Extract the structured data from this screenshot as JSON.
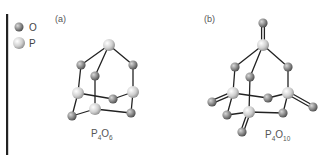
{
  "legend": {
    "items": [
      {
        "symbol": "O",
        "label": "O",
        "color": "#8a8a8a",
        "radius": 4.5
      },
      {
        "symbol": "P",
        "label": "P",
        "color": "#cfcfcf",
        "radius": 6
      }
    ]
  },
  "panels": [
    {
      "id": "a",
      "label": "(a)",
      "formula": {
        "base1": "P",
        "sub1": "4",
        "base2": "O",
        "sub2": "6"
      },
      "atoms": [
        {
          "el": "P",
          "x": 109,
          "y": 45
        },
        {
          "el": "O",
          "x": 81,
          "y": 65
        },
        {
          "el": "O",
          "x": 95,
          "y": 76
        },
        {
          "el": "O",
          "x": 133,
          "y": 65
        },
        {
          "el": "P",
          "x": 78,
          "y": 93
        },
        {
          "el": "O",
          "x": 113,
          "y": 99
        },
        {
          "el": "P",
          "x": 133,
          "y": 92
        },
        {
          "el": "P",
          "x": 95,
          "y": 109
        },
        {
          "el": "O",
          "x": 72,
          "y": 116
        },
        {
          "el": "O",
          "x": 131,
          "y": 113
        }
      ],
      "bonds": [
        [
          0,
          1
        ],
        [
          0,
          2
        ],
        [
          0,
          3
        ],
        [
          1,
          4
        ],
        [
          2,
          7
        ],
        [
          3,
          6
        ],
        [
          4,
          5
        ],
        [
          5,
          6
        ],
        [
          4,
          8
        ],
        [
          8,
          7
        ],
        [
          7,
          9
        ],
        [
          9,
          6
        ]
      ],
      "double_bonds": []
    },
    {
      "id": "b",
      "label": "(b)",
      "formula": {
        "base1": "P",
        "sub1": "4",
        "base2": "O",
        "sub2": "10"
      },
      "atoms": [
        {
          "el": "O",
          "x": 263,
          "y": 23
        },
        {
          "el": "P",
          "x": 263,
          "y": 45
        },
        {
          "el": "O",
          "x": 235,
          "y": 67
        },
        {
          "el": "O",
          "x": 250,
          "y": 77
        },
        {
          "el": "O",
          "x": 288,
          "y": 67
        },
        {
          "el": "P",
          "x": 233,
          "y": 93
        },
        {
          "el": "O",
          "x": 268,
          "y": 98
        },
        {
          "el": "P",
          "x": 288,
          "y": 93
        },
        {
          "el": "O",
          "x": 212,
          "y": 102
        },
        {
          "el": "O",
          "x": 313,
          "y": 107
        },
        {
          "el": "P",
          "x": 249,
          "y": 112
        },
        {
          "el": "O",
          "x": 227,
          "y": 115
        },
        {
          "el": "O",
          "x": 283,
          "y": 113
        },
        {
          "el": "O",
          "x": 242,
          "y": 132
        }
      ],
      "bonds": [
        [
          1,
          2
        ],
        [
          1,
          3
        ],
        [
          1,
          4
        ],
        [
          2,
          5
        ],
        [
          3,
          10
        ],
        [
          4,
          7
        ],
        [
          5,
          6
        ],
        [
          6,
          7
        ],
        [
          5,
          11
        ],
        [
          11,
          10
        ],
        [
          10,
          12
        ],
        [
          12,
          7
        ]
      ],
      "double_bonds": [
        [
          0,
          1
        ],
        [
          5,
          8
        ],
        [
          7,
          9
        ],
        [
          10,
          13
        ]
      ]
    }
  ],
  "colors": {
    "O_fill": "#8a8a8a",
    "P_fill": "#d2d2d2",
    "bond": "#222222",
    "axis_bar": "#222222"
  }
}
